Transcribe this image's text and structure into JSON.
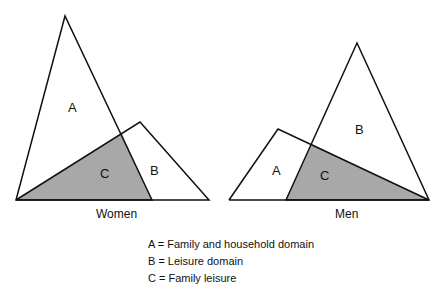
{
  "diagrams": [
    {
      "caption": "Women",
      "labels": {
        "a": "A",
        "b": "B",
        "c": "C"
      }
    },
    {
      "caption": "Men",
      "labels": {
        "a": "A",
        "b": "B",
        "c": "C"
      }
    }
  ],
  "legend": [
    "A = Family and household domain",
    "B = Leisure domain",
    "C = Family leisure"
  ],
  "colors": {
    "shade": "#a8a8a8",
    "stroke": "#111111"
  }
}
